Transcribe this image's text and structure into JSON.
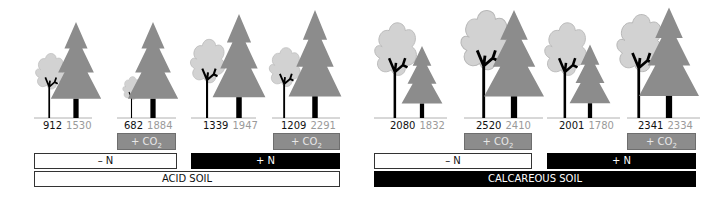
{
  "colors": {
    "conifer": "#8c8c8c",
    "broadleaf_crown": "#d2d2d2",
    "trunk": "#000000",
    "ground": "#b0b0b0",
    "co2_box": "#8c8c8c"
  },
  "panels": [
    {
      "soil": "ACID SOIL",
      "groups": [
        {
          "n_label": "– N",
          "treatments": [
            {
              "co2": null,
              "broadleaf": "912",
              "conifer": "1530"
            },
            {
              "co2": "+ CO",
              "co2_sub": "2",
              "broadleaf": "682",
              "conifer": "1884"
            }
          ]
        },
        {
          "n_label": "+ N",
          "treatments": [
            {
              "co2": null,
              "broadleaf": "1339",
              "conifer": "1947"
            },
            {
              "co2": "+ CO",
              "co2_sub": "2",
              "broadleaf": "1209",
              "conifer": "2291"
            }
          ]
        }
      ]
    },
    {
      "soil": "CALCAREOUS SOIL",
      "groups": [
        {
          "n_label": "– N",
          "treatments": [
            {
              "co2": null,
              "broadleaf": "2080",
              "conifer": "1832"
            },
            {
              "co2": "+ CO",
              "co2_sub": "2",
              "broadleaf": "2520",
              "conifer": "2410"
            }
          ]
        },
        {
          "n_label": "+ N",
          "treatments": [
            {
              "co2": null,
              "broadleaf": "2001",
              "conifer": "1780"
            },
            {
              "co2": "+ CO",
              "co2_sub": "2",
              "broadleaf": "2341",
              "conifer": "2334"
            }
          ]
        }
      ]
    }
  ]
}
